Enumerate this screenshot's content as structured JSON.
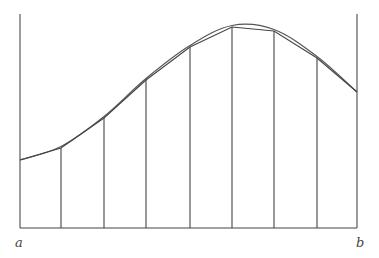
{
  "diagram": {
    "type": "trapezoidal-rule-illustration",
    "labels": {
      "left": "a",
      "right": "b"
    },
    "colors": {
      "stroke": "#444444",
      "curve": "#555555",
      "background": "#ffffff"
    },
    "baseline_y": 228,
    "boundary_top": 14,
    "subintervals": 8,
    "points": [
      {
        "x": 20,
        "y": 160
      },
      {
        "x": 61,
        "y": 148
      },
      {
        "x": 104,
        "y": 118
      },
      {
        "x": 146,
        "y": 80
      },
      {
        "x": 190,
        "y": 47
      },
      {
        "x": 232,
        "y": 27
      },
      {
        "x": 274,
        "y": 31
      },
      {
        "x": 317,
        "y": 58
      },
      {
        "x": 357,
        "y": 92
      }
    ]
  }
}
